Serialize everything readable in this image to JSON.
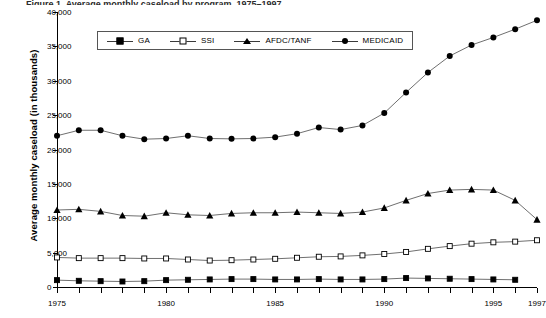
{
  "figure": {
    "title_sliver": "Figure 1. Average monthly caseload by program, 1975–1997",
    "ylabel": "Average monthly caseload (in thousands)"
  },
  "legend": {
    "position": "inside-top-left",
    "entries": [
      {
        "label": "GA",
        "marker": "filled-square-marker",
        "color": "#000000"
      },
      {
        "label": "SSI",
        "marker": "open-square-marker",
        "color": "#000000"
      },
      {
        "label": "AFDC/TANF",
        "marker": "filled-triangle-marker",
        "color": "#000000"
      },
      {
        "label": "MEDICAID",
        "marker": "filled-circle-marker",
        "color": "#000000"
      }
    ]
  },
  "axes": {
    "y_ticks": [
      "40,000",
      "35,000",
      "30,000",
      "25,000",
      "20,000",
      "15,000",
      "10,000",
      "5,000",
      "0"
    ],
    "y_tick_values": [
      40000,
      35000,
      30000,
      25000,
      20000,
      15000,
      10000,
      5000,
      0
    ],
    "x_ticks": [
      "1975",
      "1980",
      "1985",
      "1990",
      "1995",
      "1997"
    ],
    "x_tick_values": [
      1975,
      1980,
      1985,
      1990,
      1995,
      1997
    ]
  },
  "chart_data": {
    "type": "line",
    "title": "Average monthly caseload by program, 1975–1997",
    "xlabel": "",
    "ylabel": "Average monthly caseload (in thousands)",
    "xlim": [
      1975,
      1997
    ],
    "ylim": [
      0,
      40000
    ],
    "grid": false,
    "legend_position": "inside-top-left",
    "x": [
      1975,
      1976,
      1977,
      1978,
      1979,
      1980,
      1981,
      1982,
      1983,
      1984,
      1985,
      1986,
      1987,
      1988,
      1989,
      1990,
      1991,
      1992,
      1993,
      1994,
      1995,
      1996,
      1997
    ],
    "series": [
      {
        "name": "GA",
        "marker": "filled-square-marker",
        "values": [
          1000,
          900,
          850,
          800,
          850,
          1000,
          1050,
          1100,
          1150,
          1150,
          1100,
          1100,
          1150,
          1100,
          1100,
          1150,
          1300,
          1250,
          1200,
          1150,
          1100,
          1050,
          null
        ]
      },
      {
        "name": "SSI",
        "marker": "open-square-marker",
        "values": [
          4300,
          4200,
          4200,
          4200,
          4150,
          4150,
          4000,
          3850,
          3900,
          4000,
          4100,
          4250,
          4400,
          4450,
          4600,
          4800,
          5100,
          5550,
          5950,
          6300,
          6500,
          6600,
          6800
        ]
      },
      {
        "name": "AFDC/TANF",
        "marker": "filled-triangle-marker",
        "values": [
          11200,
          11300,
          11000,
          10400,
          10300,
          10800,
          10500,
          10400,
          10700,
          10800,
          10800,
          10900,
          10800,
          10700,
          10900,
          11500,
          12600,
          13600,
          14100,
          14200,
          14100,
          12600,
          9800
        ]
      },
      {
        "name": "MEDICAID",
        "marker": "filled-circle-marker",
        "values": [
          22000,
          22800,
          22800,
          22000,
          21500,
          21600,
          22000,
          21600,
          21550,
          21600,
          21800,
          22300,
          23200,
          22900,
          23500,
          25300,
          28300,
          31200,
          33600,
          35200,
          36300,
          37500,
          38800
        ]
      }
    ]
  }
}
